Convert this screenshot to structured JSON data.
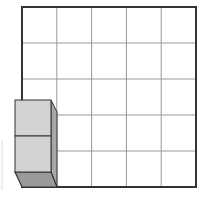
{
  "diagram": {
    "grid": {
      "rows": 5,
      "cols": 5,
      "x": 22,
      "y": 7,
      "width": 174,
      "height": 180,
      "border_color": "#333333",
      "line_color": "#999999"
    },
    "cube_stack": {
      "count": 2,
      "front_color": "#d3d3d3",
      "side_color": "#a8a8a8",
      "bottom_color": "#9a9a9a",
      "edge_color": "#333333"
    },
    "colors": {
      "background": "#ffffff"
    }
  }
}
